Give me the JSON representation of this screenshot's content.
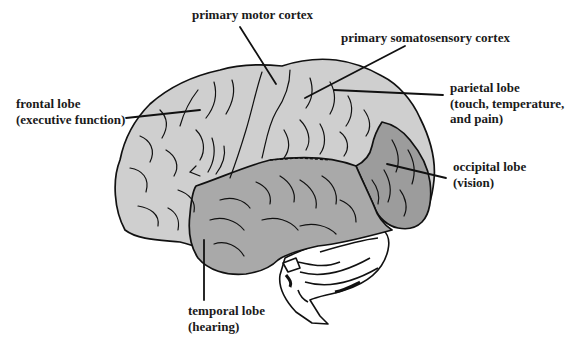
{
  "diagram": {
    "colors": {
      "background": "#ffffff",
      "frontal_parietal_fill": "#cfcfcf",
      "temporal_fill": "#a9a9a9",
      "occipital_fill": "#9c9c9c",
      "cerebellum_fill": "#ffffff",
      "outline": "#111111",
      "text": "#1a1a1a"
    },
    "labels": {
      "primary_motor_cortex": {
        "line1": "primary motor cortex"
      },
      "primary_somatosensory_cortex": {
        "line1": "primary somatosensory cortex"
      },
      "frontal_lobe": {
        "line1": "frontal lobe",
        "line2": "(executive function)"
      },
      "parietal_lobe": {
        "line1": "parietal lobe",
        "line2": "(touch, temperature,",
        "line3": "and pain)"
      },
      "occipital_lobe": {
        "line1": "occipital lobe",
        "line2": "(vision)"
      },
      "temporal_lobe": {
        "line1": "temporal lobe",
        "line2": "(hearing)"
      }
    }
  }
}
